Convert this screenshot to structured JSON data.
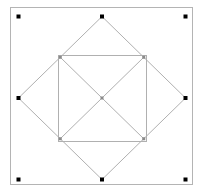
{
  "diagram": {
    "title": "",
    "colors": {
      "frame": "#b4b4b4",
      "lines": "#b0b0b0",
      "grid_dot": "#000000",
      "marker": "#8a8a8a"
    },
    "coordinate_space": {
      "x_range": [
        0,
        2
      ],
      "y_range": [
        0,
        2
      ]
    },
    "grid_points": [
      {
        "id": "top-left",
        "x": 0,
        "y": 0
      },
      {
        "id": "top-center",
        "x": 1,
        "y": 0
      },
      {
        "id": "top-right",
        "x": 2,
        "y": 0
      },
      {
        "id": "middle-left",
        "x": 0,
        "y": 1
      },
      {
        "id": "middle-right",
        "x": 2,
        "y": 1
      },
      {
        "id": "bottom-left",
        "x": 0,
        "y": 2
      },
      {
        "id": "bottom-center",
        "x": 1,
        "y": 2
      },
      {
        "id": "bottom-right",
        "x": 2,
        "y": 2
      }
    ],
    "diamond": [
      {
        "x": 1,
        "y": 0
      },
      {
        "x": 2,
        "y": 1
      },
      {
        "x": 1,
        "y": 2
      },
      {
        "x": 0,
        "y": 1
      }
    ],
    "inner_square": {
      "x0": 0.475,
      "y0": 0.475,
      "x1": 1.525,
      "y1": 1.525
    },
    "diagonals": [
      {
        "from": {
          "x": 0.5,
          "y": 0.5
        },
        "to": {
          "x": 1.5,
          "y": 1.5
        }
      },
      {
        "from": {
          "x": 1.5,
          "y": 0.5
        },
        "to": {
          "x": 0.5,
          "y": 1.5
        }
      }
    ],
    "markers": [
      {
        "id": "inner-top-left",
        "x": 0.5,
        "y": 0.5
      },
      {
        "id": "inner-top-right",
        "x": 1.5,
        "y": 0.5
      },
      {
        "id": "inner-bottom-right",
        "x": 1.5,
        "y": 1.5
      },
      {
        "id": "inner-bottom-left",
        "x": 0.5,
        "y": 1.5
      },
      {
        "id": "center",
        "x": 1,
        "y": 1
      }
    ]
  }
}
